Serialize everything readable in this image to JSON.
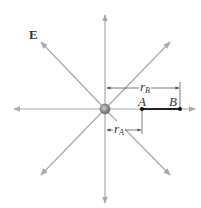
{
  "figure": {
    "field_label": "E",
    "points": {
      "A": {
        "label": "A",
        "x": 142,
        "y": 109
      },
      "B": {
        "label": "B",
        "x": 180,
        "y": 109
      }
    },
    "dimensions": {
      "r_A": {
        "symbol": "r",
        "subscript": "A"
      },
      "r_B": {
        "symbol": "r",
        "subscript": "B"
      }
    },
    "charge": {
      "x": 105,
      "y": 109
    },
    "colors": {
      "field_lines": "#a8a8a8",
      "segment": "#222222",
      "charge": "#8a8a8a"
    }
  }
}
